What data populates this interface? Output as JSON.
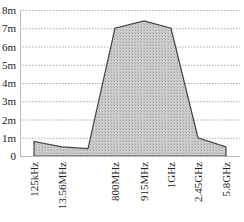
{
  "chart_data": {
    "type": "area",
    "title": "",
    "xlabel": "",
    "ylabel": "",
    "categories": [
      "125kHz",
      "13.56MHz",
      "",
      "800MHz",
      "915MHz",
      "1GHz",
      "2.45GHz",
      "5.8GHz"
    ],
    "series": [
      {
        "name": "read range",
        "values": [
          0.8,
          0.5,
          0.4,
          7.0,
          7.4,
          7.0,
          1.0,
          0.5
        ]
      }
    ],
    "y_ticks": [
      "0",
      "1m",
      "2m",
      "3m",
      "4m",
      "5m",
      "6m",
      "7m",
      "8m"
    ],
    "ylim": [
      0,
      8
    ],
    "grid": true,
    "legend": "none",
    "fill_color": "#c8c8c8",
    "line_color": "#444444"
  }
}
